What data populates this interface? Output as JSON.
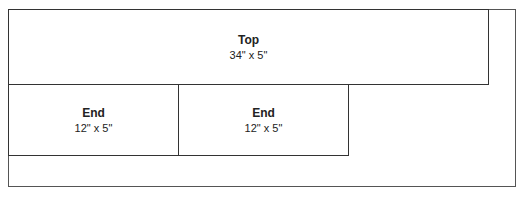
{
  "diagram": {
    "pieces": [
      {
        "name": "Top",
        "dimensions": "34\" x 5\""
      },
      {
        "name": "End",
        "dimensions": "12\" x 5\""
      },
      {
        "name": "End",
        "dimensions": "12\" x 5\""
      }
    ]
  }
}
